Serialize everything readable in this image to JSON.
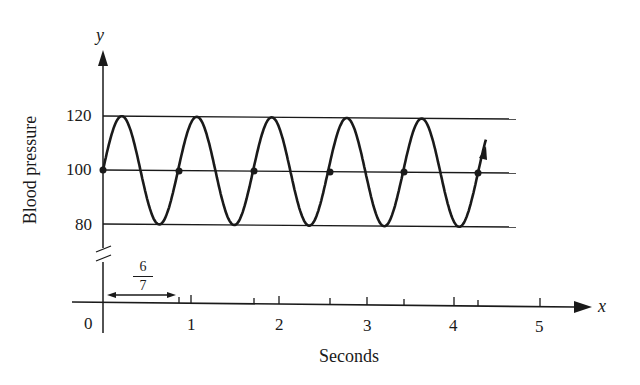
{
  "chart_data": {
    "type": "line",
    "title": "",
    "xlabel": "Seconds",
    "ylabel": "Blood pressure",
    "x_axis_symbol": "x",
    "y_axis_symbol": "y",
    "x_ticks": [
      "0",
      "1",
      "2",
      "3",
      "4",
      "5"
    ],
    "y_ticks": [
      "80",
      "100",
      "120"
    ],
    "xlim": [
      0,
      5.5
    ],
    "ylim": [
      80,
      120
    ],
    "y_axis_break": true,
    "reference_lines": [
      120,
      100,
      80
    ],
    "period_annotation": {
      "label_numerator": "6",
      "label_denominator": "7",
      "value": 0.857
    },
    "series": [
      {
        "name": "Blood pressure",
        "function": "y = 100 + 20 sin(7*pi*x/3)",
        "amplitude": 20,
        "midline": 100,
        "period": 0.857,
        "x": [
          0,
          0.214,
          0.429,
          0.643,
          0.857,
          1.071,
          1.286,
          1.5,
          1.714,
          1.929,
          2.143,
          2.357,
          2.571,
          2.786,
          3.0,
          3.214,
          3.429,
          3.643,
          3.857,
          4.071,
          4.286
        ],
        "values": [
          100,
          120,
          100,
          80,
          100,
          120,
          100,
          80,
          100,
          120,
          100,
          80,
          100,
          120,
          100,
          80,
          100,
          120,
          100,
          80,
          100
        ]
      }
    ],
    "marked_points": [
      {
        "x": 0,
        "y": 100
      },
      {
        "x": 0.857,
        "y": 100
      },
      {
        "x": 1.714,
        "y": 100
      },
      {
        "x": 2.571,
        "y": 100
      },
      {
        "x": 3.429,
        "y": 100
      },
      {
        "x": 4.286,
        "y": 100
      }
    ],
    "grid": false,
    "legend": null
  },
  "labels": {
    "y_symbol": "y",
    "x_symbol": "x",
    "ylabel": "Blood pressure",
    "xlabel": "Seconds",
    "tick_120": "120",
    "tick_100": "100",
    "tick_80": "80",
    "xt0": "0",
    "xt1": "1",
    "xt2": "2",
    "xt3": "3",
    "xt4": "4",
    "xt5": "5",
    "frac_num": "6",
    "frac_den": "7"
  }
}
